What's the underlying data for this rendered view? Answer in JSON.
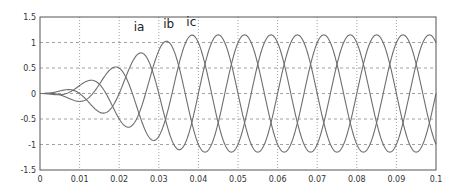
{
  "chart_data": {
    "type": "line",
    "title": "",
    "xlabel": "",
    "ylabel": "",
    "xlim": [
      0,
      0.1
    ],
    "ylim": [
      -1.5,
      1.5
    ],
    "grid": true,
    "legend": "none",
    "x_ticks": [
      "0",
      "0.01",
      "0.02",
      "0.03",
      "0.04",
      "0.05",
      "0.06",
      "0.07",
      "0.08",
      "0.09",
      "0.1"
    ],
    "y_ticks": [
      "1.5",
      "1",
      "0.5",
      "0",
      "-0.5",
      "-1",
      "-1.5"
    ],
    "annotations": [
      {
        "text": "ia",
        "x": 0.025,
        "y": 1.22
      },
      {
        "text": "ib",
        "x": 0.0325,
        "y": 1.28
      },
      {
        "text": "ic",
        "x": 0.0382,
        "y": 1.33
      }
    ],
    "series_model": {
      "frequency_hz": 50,
      "steady_amplitude": 1.15,
      "ramp_end_s": 0.04,
      "phase_shift_deg": [
        0,
        -120,
        120
      ]
    },
    "series": [
      {
        "name": "ia",
        "x": [
          0,
          0.005,
          0.01,
          0.015,
          0.02,
          0.025,
          0.03,
          0.035,
          0.04,
          0.045,
          0.05,
          0.055,
          0.06,
          0.065,
          0.07,
          0.075,
          0.08,
          0.085,
          0.09,
          0.095,
          0.1
        ],
        "values": [
          0,
          0.05,
          -0.2,
          0.3,
          -0.55,
          0.9,
          -0.85,
          1.05,
          -1.1,
          1.15,
          -1.15,
          1.15,
          -1.15,
          1.15,
          -1.15,
          1.15,
          -1.15,
          1.15,
          -1.15,
          1.15,
          -1.15
        ]
      },
      {
        "name": "ib",
        "x": [
          0,
          0.005,
          0.01,
          0.015,
          0.02,
          0.025,
          0.03,
          0.035,
          0.04,
          0.045,
          0.05,
          0.055,
          0.06,
          0.065,
          0.07,
          0.075,
          0.08,
          0.085,
          0.09,
          0.095,
          0.1
        ],
        "values": [
          0,
          -0.05,
          0.1,
          -0.5,
          0.6,
          -0.75,
          0.9,
          -1.05,
          1.1,
          -1.15,
          1.15,
          -1.15,
          1.15,
          -1.15,
          1.15,
          -1.15,
          1.15,
          -1.15,
          1.15,
          -1.15,
          1.15
        ]
      },
      {
        "name": "ic",
        "x": [
          0,
          0.005,
          0.01,
          0.015,
          0.02,
          0.025,
          0.03,
          0.035,
          0.04,
          0.045,
          0.05,
          0.055,
          0.06,
          0.065,
          0.07,
          0.075,
          0.08,
          0.085,
          0.09,
          0.095,
          0.1
        ],
        "values": [
          0,
          0.08,
          0.1,
          0.0,
          -0.25,
          0.5,
          -0.95,
          1.1,
          -1.1,
          1.15,
          -1.15,
          1.15,
          -1.15,
          1.15,
          -1.15,
          1.15,
          -1.15,
          1.15,
          -1.15,
          1.15,
          -1.15
        ]
      }
    ],
    "colors": {
      "grid": "#8a8a8a",
      "axis": "#555555",
      "line": "#6e6e6e"
    }
  }
}
